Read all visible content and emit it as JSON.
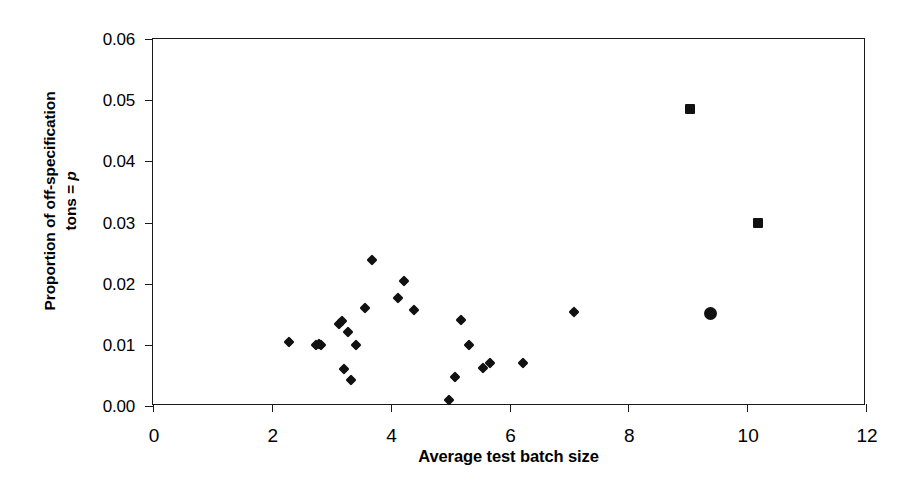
{
  "chart_data": {
    "type": "scatter",
    "title": "",
    "xlabel": "Average test batch size",
    "ylabel_line1": "Proportion of off-specification",
    "ylabel_line2_prefix": "tons = ",
    "ylabel_line2_italic": "p",
    "xlim": [
      0,
      12
    ],
    "ylim": [
      0.0,
      0.06
    ],
    "xticks": [
      0,
      2,
      4,
      6,
      8,
      10,
      12
    ],
    "xtick_labels": [
      "0",
      "2",
      "4",
      "6",
      "8",
      "10",
      "12"
    ],
    "yticks": [
      0.0,
      0.01,
      0.02,
      0.03,
      0.04,
      0.05,
      0.06
    ],
    "ytick_labels": [
      "0.00",
      "0.01",
      "0.02",
      "0.03",
      "0.04",
      "0.05",
      "0.06"
    ],
    "grid": false,
    "legend": null,
    "marker_color": "#111111",
    "series": [
      {
        "name": "Plants (diamond markers)",
        "marker": "diamond",
        "points": [
          [
            2.29,
            0.0105
          ],
          [
            2.74,
            0.01
          ],
          [
            2.8,
            0.0101
          ],
          [
            2.83,
            0.0099
          ],
          [
            3.13,
            0.0134
          ],
          [
            3.18,
            0.0139
          ],
          [
            3.22,
            0.006
          ],
          [
            3.28,
            0.0121
          ],
          [
            3.33,
            0.0042
          ],
          [
            3.41,
            0.01
          ],
          [
            3.57,
            0.016
          ],
          [
            3.69,
            0.0239
          ],
          [
            4.12,
            0.0176
          ],
          [
            4.22,
            0.0204
          ],
          [
            4.4,
            0.0157
          ],
          [
            4.98,
            0.001
          ],
          [
            5.08,
            0.0048
          ],
          [
            5.18,
            0.014
          ],
          [
            5.31,
            0.0099
          ],
          [
            5.55,
            0.0062
          ],
          [
            5.67,
            0.007
          ],
          [
            6.23,
            0.007
          ],
          [
            7.09,
            0.0153
          ]
        ]
      },
      {
        "name": "Outlier plants (square markers)",
        "marker": "square",
        "points": [
          [
            9.04,
            0.0485
          ],
          [
            10.18,
            0.03
          ]
        ]
      },
      {
        "name": "Highlighted plant (circle marker)",
        "marker": "circle",
        "points": [
          [
            9.38,
            0.0152
          ]
        ]
      }
    ]
  }
}
